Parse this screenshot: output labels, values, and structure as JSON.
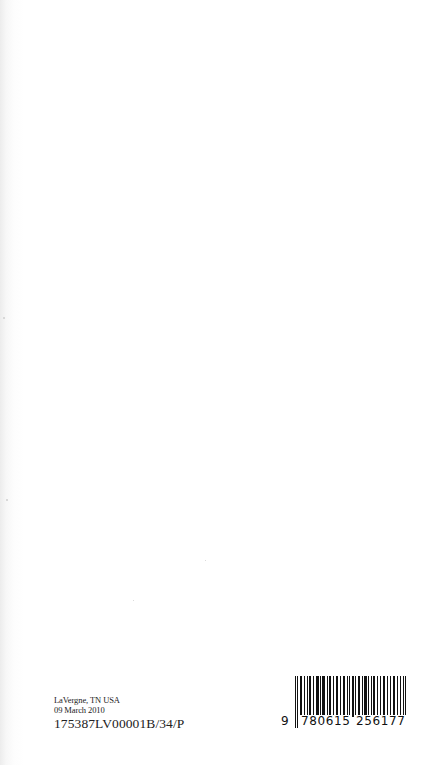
{
  "page": {
    "background": "#ffffff",
    "type": "book back page"
  },
  "imprint": {
    "location": "LaVergne, TN USA",
    "date": "09 March 2010",
    "print_code": "175387LV00001B/34/P"
  },
  "barcode": {
    "type": "ISBN EAN-13",
    "lead_digit": "9",
    "left_group": "780615",
    "right_group": "256177",
    "full": "9780615256177"
  }
}
